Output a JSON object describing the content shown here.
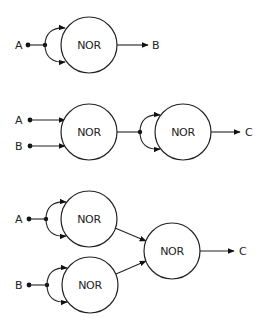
{
  "diagrams": [
    {
      "id": "not-gate-from-nor",
      "inputs": [
        {
          "label": "A"
        }
      ],
      "gates": [
        {
          "label": "NOR"
        }
      ],
      "output": {
        "label": "B"
      }
    },
    {
      "id": "or-gate-from-nor",
      "inputs": [
        {
          "label": "A"
        },
        {
          "label": "B"
        }
      ],
      "gates": [
        {
          "label": "NOR"
        },
        {
          "label": "NOR"
        }
      ],
      "output": {
        "label": "C"
      }
    },
    {
      "id": "and-gate-from-nor",
      "inputs": [
        {
          "label": "A"
        },
        {
          "label": "B"
        }
      ],
      "gates": [
        {
          "label": "NOR"
        },
        {
          "label": "NOR"
        },
        {
          "label": "NOR"
        }
      ],
      "output": {
        "label": "C"
      }
    }
  ],
  "colors": {
    "stroke": "#222222",
    "background": "#ffffff"
  }
}
